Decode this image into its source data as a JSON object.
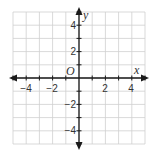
{
  "chart_data": {
    "type": "coordinate-plane",
    "title": "",
    "xlabel": "x",
    "ylabel": "y",
    "origin_label": "O",
    "xlim": [
      -5,
      5
    ],
    "ylim": [
      -5,
      5
    ],
    "grid": true,
    "grid_step": 1,
    "x_tick_labels": [
      "−4",
      "−2",
      "2",
      "4"
    ],
    "x_tick_values": [
      -4,
      -2,
      2,
      4
    ],
    "y_tick_labels": [
      "4",
      "2",
      "−2",
      "−4"
    ],
    "y_tick_values": [
      4,
      2,
      -2,
      -4
    ],
    "series": []
  },
  "colors": {
    "grid": "#cfcfcf",
    "axis": "#1a1a1a",
    "text": "#333333"
  }
}
